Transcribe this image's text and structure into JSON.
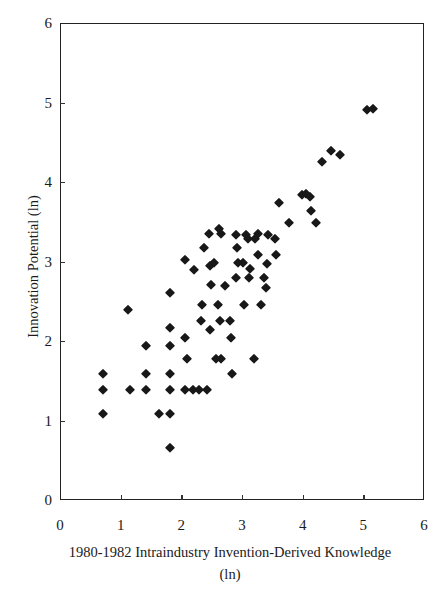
{
  "chart_data": {
    "type": "scatter",
    "title": "",
    "xlabel": "1980-1982 Intraindustry Invention-Derived Knowledge",
    "xlabel_line2": "(ln)",
    "ylabel": "Innovation Potential (ln)",
    "xlim": [
      0,
      6
    ],
    "ylim": [
      0,
      6
    ],
    "xticks": [
      0,
      1,
      2,
      3,
      4,
      5,
      6
    ],
    "yticks": [
      0,
      1,
      2,
      3,
      4,
      5,
      6
    ],
    "xtick_labels": [
      "0",
      "1",
      "2",
      "3",
      "4",
      "5",
      "6"
    ],
    "ytick_labels": [
      "0",
      "1",
      "2",
      "3",
      "4",
      "5",
      "6"
    ],
    "grid": false,
    "legend": false,
    "marker": "diamond",
    "marker_color": "#181818",
    "n_points": 75,
    "series": [
      {
        "name": "observations",
        "points": [
          [
            0.7,
            1.6
          ],
          [
            0.7,
            1.4
          ],
          [
            0.7,
            1.1
          ],
          [
            1.1,
            2.4
          ],
          [
            1.13,
            1.4
          ],
          [
            1.4,
            1.95
          ],
          [
            1.4,
            1.6
          ],
          [
            1.4,
            1.4
          ],
          [
            1.62,
            1.1
          ],
          [
            1.8,
            2.62
          ],
          [
            1.8,
            2.18
          ],
          [
            1.8,
            1.95
          ],
          [
            1.8,
            1.6
          ],
          [
            1.8,
            1.4
          ],
          [
            1.8,
            1.1
          ],
          [
            1.8,
            0.67
          ],
          [
            2.05,
            3.03
          ],
          [
            2.05,
            2.05
          ],
          [
            2.05,
            1.4
          ],
          [
            2.08,
            1.78
          ],
          [
            2.17,
            1.4
          ],
          [
            2.28,
            1.4
          ],
          [
            2.4,
            1.4
          ],
          [
            2.3,
            2.27
          ],
          [
            2.32,
            2.47
          ],
          [
            2.46,
            2.15
          ],
          [
            2.56,
            1.78
          ],
          [
            2.64,
            1.78
          ],
          [
            2.62,
            2.27
          ],
          [
            2.58,
            2.47
          ],
          [
            2.78,
            2.27
          ],
          [
            2.8,
            2.05
          ],
          [
            2.82,
            1.6
          ],
          [
            2.88,
            2.8
          ],
          [
            2.88,
            3.35
          ],
          [
            2.9,
            3.18
          ],
          [
            2.92,
            3.0
          ],
          [
            3.0,
            3.0
          ],
          [
            3.02,
            2.47
          ],
          [
            3.1,
            2.8
          ],
          [
            3.12,
            2.92
          ],
          [
            3.18,
            1.78
          ],
          [
            3.2,
            3.3
          ],
          [
            3.24,
            3.36
          ],
          [
            3.25,
            3.1
          ],
          [
            3.3,
            2.47
          ],
          [
            3.35,
            2.8
          ],
          [
            3.38,
            2.68
          ],
          [
            3.42,
            3.35
          ],
          [
            3.4,
            2.98
          ],
          [
            3.55,
            3.1
          ],
          [
            3.52,
            3.3
          ],
          [
            3.6,
            3.75
          ],
          [
            3.75,
            3.5
          ],
          [
            3.98,
            3.85
          ],
          [
            4.04,
            3.86
          ],
          [
            4.1,
            3.82
          ],
          [
            4.12,
            3.65
          ],
          [
            4.2,
            3.5
          ],
          [
            4.3,
            4.26
          ],
          [
            4.45,
            4.4
          ],
          [
            4.6,
            4.35
          ],
          [
            5.05,
            4.92
          ],
          [
            5.14,
            4.93
          ],
          [
            2.45,
            2.95
          ],
          [
            2.48,
            2.72
          ],
          [
            2.7,
            2.7
          ],
          [
            2.2,
            2.9
          ],
          [
            2.52,
            3.0
          ],
          [
            3.05,
            3.35
          ],
          [
            3.08,
            3.3
          ],
          [
            2.35,
            3.18
          ],
          [
            2.44,
            3.36
          ],
          [
            2.6,
            3.42
          ],
          [
            2.64,
            3.36
          ]
        ]
      }
    ]
  }
}
